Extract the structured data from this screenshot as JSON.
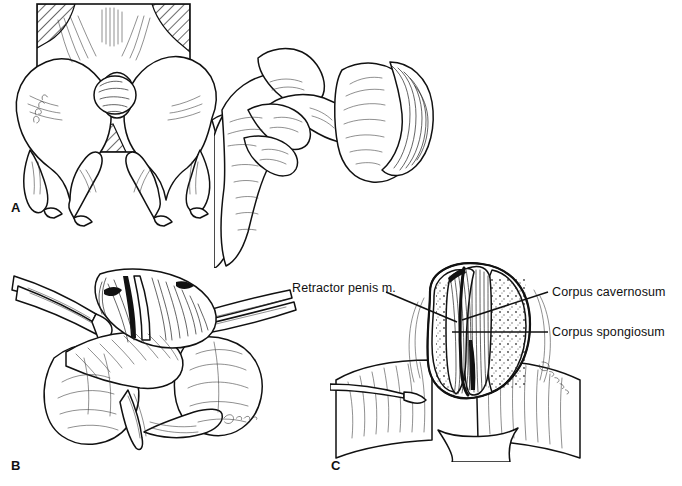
{
  "figure": {
    "type": "medical-illustration",
    "background_color": "#ffffff",
    "ink_color": "#111111",
    "width": 682,
    "height": 486
  },
  "panels": [
    {
      "id": "A",
      "letter": "A",
      "caption": "",
      "description": "Dorsal recumbent dog hindquarters within hatched drape window; hand retracting prepuce to expose glans penis",
      "artist_signature": "F. Clark"
    },
    {
      "id": "B",
      "letter": "B",
      "caption": "",
      "description": "Exposed penis with thumb forceps and scissors incising the tissue between the testes",
      "artist_signature": "F. Clark"
    },
    {
      "id": "C",
      "letter": "C",
      "caption": "",
      "description": "Cross-sectional view of transected penis showing labelled erectile structures",
      "artist_signature": "F. Clark"
    }
  ],
  "annotations": [
    {
      "id": "retractor-penis-m",
      "text": "Retractor penis m.",
      "align": "right",
      "label_x": 292,
      "label_y": 281,
      "leader": {
        "x1": 386,
        "y1": 292,
        "x2": 457,
        "y2": 322
      }
    },
    {
      "id": "corpus-cavernosum",
      "text": "Corpus cavernosum",
      "align": "left",
      "label_x": 552,
      "label_y": 285,
      "leader": {
        "x1": 548,
        "y1": 292,
        "x2": 462,
        "y2": 320
      }
    },
    {
      "id": "corpus-spongiosum",
      "text": "Corpus spongiosum",
      "align": "left",
      "label_x": 552,
      "label_y": 325,
      "leader": {
        "x1": 548,
        "y1": 332,
        "x2": 452,
        "y2": 332
      }
    }
  ],
  "panel_letters": [
    {
      "letter": "A",
      "x": 11,
      "y": 200
    },
    {
      "letter": "B",
      "x": 11,
      "y": 458
    },
    {
      "letter": "C",
      "x": 331,
      "y": 458
    }
  ]
}
